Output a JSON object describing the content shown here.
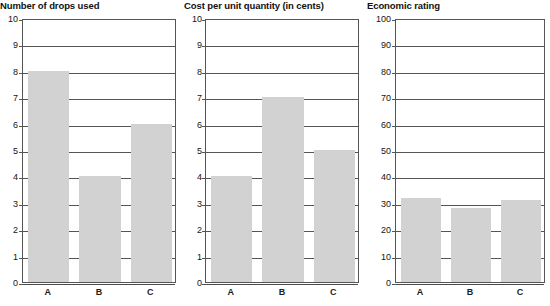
{
  "chart_data": [
    {
      "type": "bar",
      "title": "Number of drops used",
      "categories": [
        "A",
        "B",
        "C"
      ],
      "values": [
        8,
        4,
        6
      ],
      "xlabel": "",
      "ylabel": "",
      "ylim": [
        0,
        10
      ],
      "ytick_step": 1,
      "yticks": [
        "0",
        "1",
        "2",
        "3",
        "4",
        "5",
        "6",
        "7",
        "8",
        "9",
        "10"
      ],
      "grid": true,
      "legend": "none",
      "bar_color": "#d2d2d2"
    },
    {
      "type": "bar",
      "title": "Cost per unit quantity (in cents)",
      "categories": [
        "A",
        "B",
        "C"
      ],
      "values": [
        4,
        7,
        5
      ],
      "xlabel": "",
      "ylabel": "",
      "ylim": [
        0,
        10
      ],
      "ytick_step": 1,
      "yticks": [
        "0",
        "1",
        "2",
        "3",
        "4",
        "5",
        "6",
        "7",
        "8",
        "9",
        "10"
      ],
      "grid": true,
      "legend": "none",
      "bar_color": "#d2d2d2"
    },
    {
      "type": "bar",
      "title": "Economic rating",
      "categories": [
        "A",
        "B",
        "C"
      ],
      "values": [
        32,
        28,
        31
      ],
      "xlabel": "",
      "ylabel": "",
      "ylim": [
        0,
        100
      ],
      "ytick_step": 10,
      "yticks": [
        "0",
        "10",
        "20",
        "30",
        "40",
        "50",
        "60",
        "70",
        "80",
        "90",
        "100"
      ],
      "grid": true,
      "legend": "none",
      "bar_color": "#d2d2d2"
    }
  ]
}
